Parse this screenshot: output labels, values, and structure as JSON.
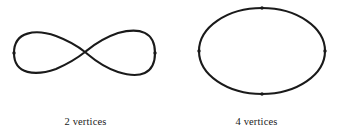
{
  "figure": {
    "background_color": "#ffffff",
    "stroke_color": "#1a1a1a",
    "vertex_color": "#1a1a1a",
    "width": 342,
    "height": 134
  },
  "panels": [
    {
      "id": "lemniscate",
      "shape_name": "figure-eight-curve",
      "caption": "2 vertices",
      "vertex_count": 2,
      "stroke_width": 2.1,
      "vertex_marker_size": 3.4,
      "crossing_point": {
        "x": 85,
        "y": 52
      },
      "path": "M 14,53 C 14,31 36,29 56,36 C 72,42 80,48 85,52 C 90,56 100,66 118,72 C 140,79 155,74 155,53 C 155,32 140,27 118,33 C 100,39 90,48 85,52 C 80,56 72,62 56,69 C 36,76 14,75 14,53 Z",
      "vertices": [
        {
          "x": 14,
          "y": 53
        },
        {
          "x": 155,
          "y": 53
        }
      ]
    },
    {
      "id": "ellipse",
      "shape_name": "ellipse-curve",
      "caption": "4 vertices",
      "vertex_count": 4,
      "stroke_width": 2.1,
      "vertex_marker_size": 3.4,
      "center": {
        "x": 262,
        "y": 51
      },
      "radius_x": 63,
      "radius_y": 43,
      "vertices": [
        {
          "x": 262,
          "y": 8
        },
        {
          "x": 325,
          "y": 51
        },
        {
          "x": 262,
          "y": 94
        },
        {
          "x": 199,
          "y": 51
        }
      ]
    }
  ],
  "chart_data": {
    "type": "diagram",
    "title": "",
    "items": [
      {
        "label": "2 vertices",
        "shape": "figure-eight-curve",
        "value": 2
      },
      {
        "label": "4 vertices",
        "shape": "ellipse-curve",
        "value": 4
      }
    ]
  }
}
